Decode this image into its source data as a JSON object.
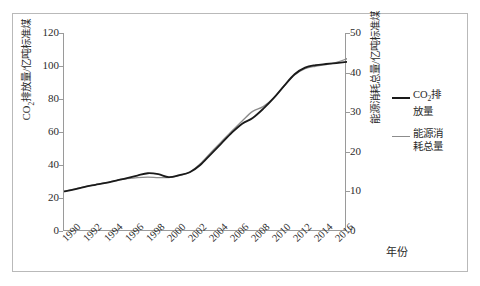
{
  "chart_data": {
    "type": "line",
    "title": "",
    "xlabel": "年份",
    "ylabel": "CO₂排放量/亿吨标准煤",
    "ylabel_secondary": "能源消耗总量/亿吨标准煤",
    "x": [
      1990,
      1991,
      1992,
      1993,
      1994,
      1995,
      1996,
      1997,
      1998,
      1999,
      2000,
      2001,
      2002,
      2003,
      2004,
      2005,
      2006,
      2007,
      2008,
      2009,
      2010,
      2011,
      2012,
      2013,
      2014,
      2015,
      2016,
      2017
    ],
    "xlim": [
      1990,
      2017
    ],
    "xticks": [
      1990,
      1992,
      1994,
      1996,
      1998,
      2000,
      2002,
      2004,
      2006,
      2008,
      2010,
      2012,
      2014,
      2016
    ],
    "xtick_labels": [
      "1990",
      "1992",
      "1994",
      "1996",
      "1998",
      "2000",
      "2002",
      "2004",
      "2006",
      "2008",
      "2010",
      "2012",
      "2014",
      "2016"
    ],
    "ylim": [
      0,
      120
    ],
    "yticks": [
      0,
      20,
      40,
      60,
      80,
      100,
      120
    ],
    "ytick_labels": [
      "0",
      "20",
      "40",
      "60",
      "80",
      "100",
      "120"
    ],
    "ylim_secondary": [
      0,
      50
    ],
    "yticks_secondary": [
      0,
      10,
      20,
      30,
      40,
      50
    ],
    "ytick_labels_secondary": [
      "0",
      "10",
      "20",
      "30",
      "40",
      "50"
    ],
    "grid": false,
    "legend_position": "right",
    "series": [
      {
        "name": "CO₂排放量",
        "axis": "left",
        "color": "#1a1a1a",
        "values": [
          24.0,
          25.2,
          26.8,
          28.0,
          29.2,
          30.6,
          32.0,
          33.6,
          35.0,
          34.4,
          32.6,
          33.8,
          35.6,
          40.0,
          46.5,
          53.0,
          59.5,
          65.0,
          68.5,
          74.0,
          80.5,
          88.0,
          95.0,
          99.0,
          100.5,
          101.2,
          101.8,
          102.5
        ]
      },
      {
        "name": "能源消耗总量",
        "axis": "right",
        "color": "#8c8c8c",
        "values": [
          10.0,
          10.6,
          11.2,
          11.7,
          12.2,
          12.8,
          13.2,
          13.5,
          13.6,
          13.5,
          13.5,
          14.0,
          14.9,
          17.0,
          19.8,
          22.5,
          25.2,
          27.8,
          30.2,
          31.4,
          33.6,
          36.6,
          39.4,
          41.0,
          41.6,
          42.0,
          42.6,
          43.5
        ]
      }
    ]
  },
  "axes": {
    "left_title": "CO₂排放量/亿吨标准煤",
    "right_title": "能源消耗总量/亿吨标准煤",
    "x_title": "年份"
  },
  "legend": {
    "items": [
      {
        "label_line1": "CO₂排",
        "label_line2": "放量",
        "color": "#1a1a1a"
      },
      {
        "label_line1": "能源消",
        "label_line2": "耗总量",
        "color": "#8c8c8c"
      }
    ]
  }
}
